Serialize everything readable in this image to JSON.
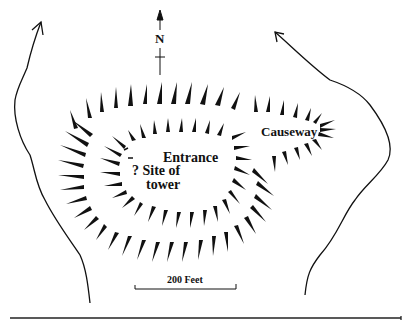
{
  "map": {
    "type": "hachured earthwork plan",
    "north_label": "N",
    "labels": {
      "entrance": "Entrance",
      "site_of_tower_line1": "? Site of",
      "site_of_tower_line2": "tower",
      "causeway": "Causeway"
    },
    "scale_bar": {
      "label": "200 Feet"
    },
    "colors": {
      "ink": "#111111",
      "background": "#ffffff"
    }
  }
}
